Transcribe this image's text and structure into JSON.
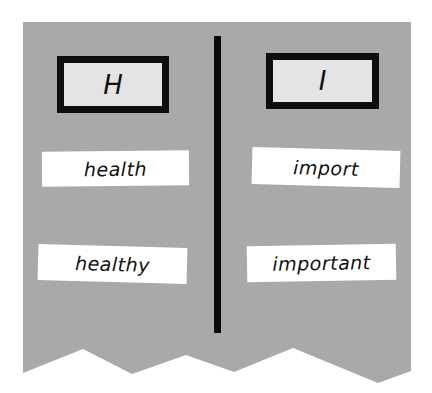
{
  "colors": {
    "panel": "#a9a9a9",
    "border": "#0e0e0e",
    "letter_box_fill": "#e4e4e4",
    "card_fill": "#ffffff"
  },
  "columns": [
    {
      "letter": "H",
      "words": [
        "health",
        "healthy"
      ]
    },
    {
      "letter": "I",
      "words": [
        "import",
        "important"
      ]
    }
  ]
}
